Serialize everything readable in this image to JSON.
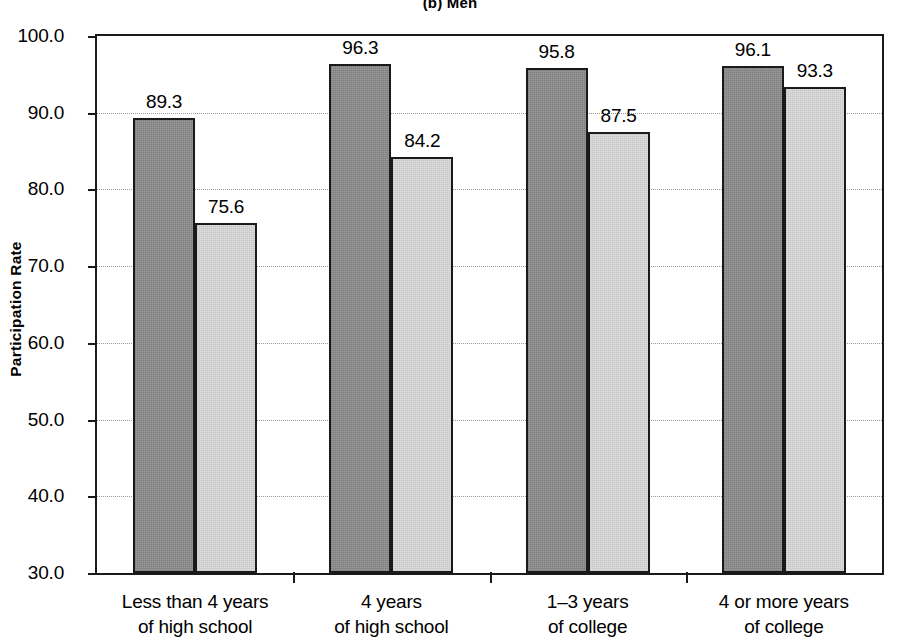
{
  "chart_data": {
    "type": "bar",
    "title": "(b) Men",
    "xlabel": "",
    "ylabel": "Participation Rate",
    "ylim": [
      30.0,
      100.0
    ],
    "ytick_step": 10.0,
    "ytick_labels": [
      "100.0",
      "90.0",
      "80.0",
      "70.0",
      "60.0",
      "50.0",
      "40.0",
      "30.0"
    ],
    "ytick_values": [
      100.0,
      90.0,
      80.0,
      70.0,
      60.0,
      50.0,
      40.0,
      30.0
    ],
    "grid": true,
    "grid_axis": "y",
    "legend": "none",
    "categories": [
      "Less than 4 years\nof high school",
      "4 years\nof high school",
      "1–3 years\nof college",
      "4 or more years\nof college"
    ],
    "category_lines": [
      [
        "Less than 4 years",
        "of high school"
      ],
      [
        "4 years",
        "of high school"
      ],
      [
        "1–3 years",
        "of college"
      ],
      [
        "4 or more years",
        "of college"
      ]
    ],
    "series": [
      {
        "name": "dark-series",
        "color": "#8d8d8d",
        "values": [
          89.3,
          96.3,
          95.8,
          96.1
        ],
        "labels": [
          "89.3",
          "96.3",
          "95.8",
          "96.1"
        ]
      },
      {
        "name": "light-series",
        "color": "#d9d9d9",
        "values": [
          75.6,
          84.2,
          87.5,
          93.3
        ],
        "labels": [
          "75.6",
          "84.2",
          "87.5",
          "93.3"
        ]
      }
    ]
  },
  "colors": {
    "dark_bar": "#8d8d8d",
    "light_bar": "#d9d9d9",
    "axis": "#1a1a1a",
    "gridline": "#9a9a9a",
    "background": "#ffffff"
  }
}
